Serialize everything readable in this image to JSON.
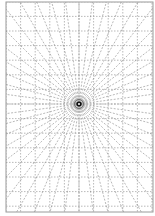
{
  "diagram": {
    "type": "one-point perspective grid",
    "frame": {
      "x": 6,
      "y": 2,
      "width": 147,
      "height": 210,
      "color": "#9a9a9a"
    },
    "vanishing_point": {
      "x": 79,
      "y": 104
    },
    "grid_spacing": 14.6,
    "ray_count": 48,
    "line_color": "#8a8a8a",
    "center_marker_color": "#111111"
  }
}
